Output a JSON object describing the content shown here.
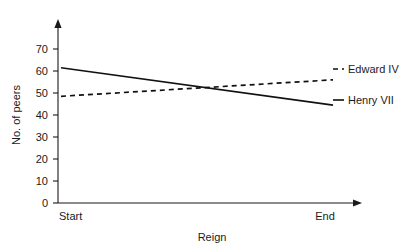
{
  "chart_data": {
    "type": "line",
    "title": "",
    "xlabel": "Reign",
    "ylabel": "No. of peers",
    "x": [
      "Start",
      "End"
    ],
    "xtick_labels": [
      "Start",
      "End"
    ],
    "ytick_labels": [
      "0",
      "10",
      "20",
      "30",
      "40",
      "50",
      "60",
      "70"
    ],
    "ytick_values": [
      0,
      10,
      20,
      30,
      40,
      50,
      60,
      70
    ],
    "ylim": [
      0,
      75
    ],
    "grid": false,
    "legend_position": "right-inline",
    "series": [
      {
        "name": "Edward IV",
        "style": "dashed",
        "color": "#111111",
        "values": [
          48.5,
          56.0
        ]
      },
      {
        "name": "Henry VII",
        "style": "solid",
        "color": "#111111",
        "values": [
          61.5,
          44.5
        ]
      }
    ],
    "annotations": []
  },
  "axes": {
    "y_axis_title": "No. of peers",
    "x_axis_title": "Reign",
    "x_start_label": "Start",
    "x_end_label": "End"
  },
  "legend": {
    "edward_label": "Edward IV",
    "henry_label": "Henry VII"
  },
  "yticks": {
    "t0": "0",
    "t10": "10",
    "t20": "20",
    "t30": "30",
    "t40": "40",
    "t50": "50",
    "t60": "60",
    "t70": "70"
  },
  "colors": {
    "ink": "#1a1a1a",
    "series": "#111111",
    "background": "#ffffff"
  }
}
